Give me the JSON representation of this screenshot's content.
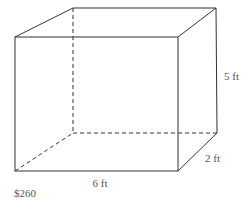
{
  "diagram": {
    "type": "rectangular-prism",
    "dimensions": {
      "length": "6 ft",
      "width": "2 ft",
      "height": "5 ft"
    },
    "labels": {
      "length_label": "6 ft",
      "width_label": "2 ft",
      "height_label": "5 ft",
      "price_label": "$260"
    },
    "colors": {
      "edge": "#333333",
      "label": "#555555",
      "background": "#ffffff"
    }
  }
}
